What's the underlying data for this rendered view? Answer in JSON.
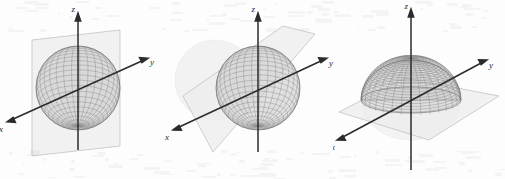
{
  "figure": {
    "background_color": "#fdfdfd",
    "panel_count": 3
  },
  "style": {
    "axis_color": "#2b2b2b",
    "sphere_mesh_color": "#6e6e6e",
    "sphere_fill_color": "#c9c9c9",
    "sphere_ghost_color": "#d8d8d8",
    "plane_fill_color": "#ebebeb",
    "plane_edge_color": "#b8b8b8",
    "label_color": "#2b2b2b"
  },
  "chart_data": {
    "type": "scatter",
    "xlabel": "x",
    "ylabel": "y",
    "zlabel": "z",
    "grid": false,
    "legend": "none",
    "panels": [
      {
        "id": "panel-1",
        "axes": [
          "x",
          "y",
          "z"
        ],
        "axis_labels": {
          "x": "x",
          "y": "y",
          "z": "z"
        },
        "sphere": {
          "center": [
            0,
            0,
            0
          ],
          "radius": 1,
          "rendering": "wireframe-mesh",
          "mesh_u": 32,
          "mesh_v": 24
        },
        "plane": {
          "orientation": "vertical",
          "normal_axis": "y",
          "label": "plane perpendicular to y-axis"
        },
        "ghost_region": "behind-plane"
      },
      {
        "id": "panel-2",
        "axes": [
          "x",
          "y",
          "z"
        ],
        "axis_labels": {
          "x": "x",
          "y": "y",
          "z": "z"
        },
        "sphere": {
          "center": [
            0,
            0,
            0
          ],
          "radius": 1,
          "rendering": "wireframe-mesh",
          "mesh_u": 32,
          "mesh_v": 24
        },
        "plane": {
          "orientation": "vertical",
          "normal_axis": "x",
          "label": "plane perpendicular to x-axis"
        },
        "ghost_region": "behind-plane"
      },
      {
        "id": "panel-3",
        "axes": [
          "x",
          "y",
          "z"
        ],
        "axis_labels": {
          "x": "x",
          "y": "y",
          "z": "z"
        },
        "sphere": {
          "center": [
            0,
            0,
            0
          ],
          "radius": 1,
          "rendering": "wireframe-mesh",
          "mesh_u": 32,
          "mesh_v": 24
        },
        "plane": {
          "orientation": "horizontal",
          "normal_axis": "z",
          "label": "plane perpendicular to z-axis (xy-plane)"
        },
        "ghost_region": "below-plane"
      }
    ]
  },
  "labels": {
    "x": "x",
    "y": "y",
    "z": "z"
  }
}
